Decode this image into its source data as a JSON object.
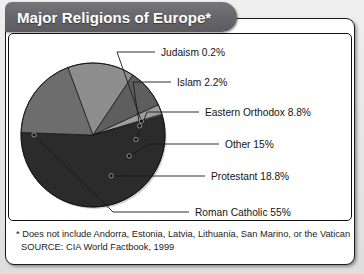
{
  "title": "Major Religions of Europe*",
  "footnotes": [
    "* Does not include Andorra, Estonia, Latvia, Lithuania, San Marino, or the Vatican",
    "SOURCE: CIA World Factbook, 1999"
  ],
  "colors": {
    "background": "#e9e9e9",
    "panel": "#ffffff",
    "frame": "#1b1b1b",
    "title_bar": "#68686c",
    "title_text": "#ffffff",
    "roman_catholic": "#2b2b2b",
    "protestant": "#6d6d6d",
    "other": "#8d8d8d",
    "eastern_orthodox": "#5e5e5e",
    "islam": "#9e9e9e",
    "judaism": "#c9c9c9",
    "leader_line": "#1a1a1a"
  },
  "chart_data": {
    "type": "pie",
    "title": "Major Religions of Europe*",
    "xlabel": "",
    "ylabel": "",
    "legend_position": "callout-labels-right",
    "grid": false,
    "units": "percent",
    "categories": [
      "Roman Catholic",
      "Protestant",
      "Other",
      "Eastern Orthodox",
      "Islam",
      "Judaism"
    ],
    "values": [
      55,
      18.8,
      15,
      8.8,
      2.2,
      0.2
    ],
    "slices": [
      {
        "name": "Roman Catholic",
        "value": 55,
        "label": "Roman Catholic 55%",
        "color": "#2b2b2b",
        "callout_text_x": 186,
        "callout_text_y": 178,
        "dot_r": 0.82,
        "dot_angle_deg": 180,
        "elbow_x": 104,
        "elbow_y": 178
      },
      {
        "name": "Protestant",
        "value": 18.8,
        "label": "Protestant 18.8%",
        "color": "#6d6d6d",
        "callout_text_x": 202,
        "callout_text_y": 142,
        "dot_r": 0.62,
        "dot_angle_deg": 66,
        "elbow_x": 128,
        "elbow_y": 142
      },
      {
        "name": "Other",
        "value": 15,
        "label": "Other 15%",
        "color": "#8d8d8d",
        "callout_text_x": 216,
        "callout_text_y": 110,
        "dot_r": 0.58,
        "dot_angle_deg": 30,
        "elbow_x": 140,
        "elbow_y": 110
      },
      {
        "name": "Eastern Orthodox",
        "value": 8.8,
        "label": "Eastern Orthodox 8.8%",
        "color": "#5e5e5e",
        "callout_text_x": 196,
        "callout_text_y": 78,
        "dot_r": 0.6,
        "dot_angle_deg": 6,
        "elbow_x": 138,
        "elbow_y": 78
      },
      {
        "name": "Islam",
        "value": 2.2,
        "label": "Islam 2.2%",
        "color": "#9e9e9e",
        "callout_text_x": 168,
        "callout_text_y": 48,
        "dot_r": 0.66,
        "dot_angle_deg": -11,
        "elbow_x": 124,
        "elbow_y": 48
      },
      {
        "name": "Judaism",
        "value": 0.2,
        "label": "Judaism 0.2%",
        "color": "#c9c9c9",
        "callout_text_x": 152,
        "callout_text_y": 18,
        "dot_r": 0.7,
        "dot_angle_deg": -16,
        "elbow_x": 108,
        "elbow_y": 18
      }
    ],
    "geometry": {
      "cx": 84,
      "cy": 101,
      "r": 72,
      "start_angle_deg": -16
    }
  }
}
